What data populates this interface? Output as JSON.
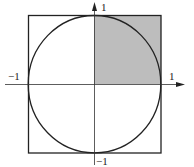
{
  "diagram": {
    "labels": {
      "y_top": "1",
      "y_bottom": "−1",
      "x_left": "−1",
      "x_right": "1"
    },
    "colors": {
      "stroke": "#222222",
      "shade": "#bdbdbd",
      "background": "#ffffff"
    },
    "shapes": {
      "square": {
        "x_min": -1,
        "x_max": 1,
        "y_min": -1,
        "y_max": 1
      },
      "circle": {
        "cx": 0,
        "cy": 0,
        "r": 1
      },
      "shaded_region": {
        "x_min": 0,
        "x_max": 1,
        "y_min": 0,
        "y_max": 1
      }
    }
  }
}
